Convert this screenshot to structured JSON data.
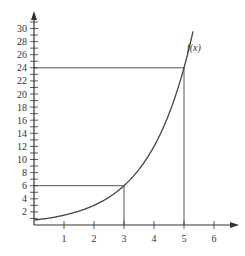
{
  "chart_data": {
    "type": "line",
    "title": "",
    "xlabel": "",
    "ylabel": "",
    "xlim": [
      0,
      6.5
    ],
    "ylim": [
      0,
      31
    ],
    "grid": false,
    "x_ticks": [
      1,
      2,
      3,
      4,
      5,
      6
    ],
    "y_tick_labels": [
      2,
      4,
      6,
      8,
      10,
      12,
      14,
      16,
      18,
      20,
      22,
      24,
      26,
      28,
      30
    ],
    "y_minor_tick_step": 1,
    "series": [
      {
        "name": "f(x)",
        "label": "f(x)",
        "x": [
          0,
          0.5,
          1,
          1.5,
          2,
          2.5,
          3,
          3.5,
          4,
          4.5,
          5,
          5.3
        ],
        "y": [
          0.75,
          1.07,
          1.5,
          2.12,
          3.0,
          4.24,
          6.0,
          8.49,
          12.0,
          16.97,
          24.0,
          29.6
        ],
        "color": "#444444"
      }
    ],
    "annotations": [
      {
        "type": "hline",
        "y": 24,
        "x_from": 0,
        "x_to": 5
      },
      {
        "type": "vline",
        "x": 5,
        "y_from": 0,
        "y_to": 24
      },
      {
        "type": "hline",
        "y": 6,
        "x_from": 0,
        "x_to": 3
      },
      {
        "type": "vline",
        "x": 3,
        "y_from": 0,
        "y_to": 6
      }
    ]
  },
  "labels": {
    "function": "f(x)",
    "x_ticks": [
      "1",
      "2",
      "3",
      "4",
      "5",
      "6"
    ],
    "y_ticks": [
      "2",
      "4",
      "6",
      "8",
      "10",
      "12",
      "14",
      "16",
      "18",
      "20",
      "22",
      "24",
      "26",
      "28",
      "30"
    ]
  },
  "colors": {
    "axis": "#333333",
    "curve": "#444444",
    "guide": "#555555"
  }
}
